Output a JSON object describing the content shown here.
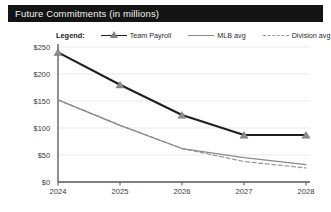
{
  "header": {
    "title": "Future Commitments (in millions)"
  },
  "legend": {
    "title": "Legend:",
    "items": [
      {
        "label": "Team Payroll",
        "style": "line-marker",
        "color": "#1f1f1f",
        "marker": "triangle"
      },
      {
        "label": "MLB avg",
        "style": "solid",
        "color": "#8a8a8a"
      },
      {
        "label": "Division avg",
        "style": "dashed",
        "color": "#9a9a9a"
      }
    ]
  },
  "chart_data": {
    "type": "line",
    "title": "Future Commitments (in millions)",
    "xlabel": "",
    "ylabel": "",
    "x": [
      "2024",
      "2025",
      "2026",
      "2027",
      "2028"
    ],
    "categories": [
      "2024",
      "2025",
      "2026",
      "2027",
      "2028"
    ],
    "ylim": [
      0,
      250
    ],
    "yticks": [
      0,
      50,
      100,
      150,
      200,
      250
    ],
    "ytick_labels": [
      "$0",
      "$50",
      "$100",
      "$150",
      "$200",
      "$250"
    ],
    "xtick_labels": [
      "2024",
      "2025",
      "2026",
      "2027",
      "2028"
    ],
    "grid": true,
    "legend_position": "top",
    "series": [
      {
        "name": "Team Payroll",
        "values": [
          240,
          180,
          124,
          87,
          87
        ],
        "color": "#1f1f1f",
        "marker": "triangle",
        "dash": false
      },
      {
        "name": "MLB avg",
        "values": [
          152,
          105,
          62,
          45,
          32
        ],
        "color": "#8a8a8a",
        "marker": "none",
        "dash": false
      },
      {
        "name": "Division avg",
        "values": [
          152,
          105,
          62,
          38,
          26
        ],
        "color": "#9a9a9a",
        "marker": "none",
        "dash": true
      }
    ]
  },
  "axes": {
    "y_tick_labels": [
      "$250",
      "$200",
      "$150",
      "$100",
      "$50",
      "$0"
    ],
    "x_tick_labels": [
      "2024",
      "2025",
      "2026",
      "2027",
      "2028"
    ]
  }
}
